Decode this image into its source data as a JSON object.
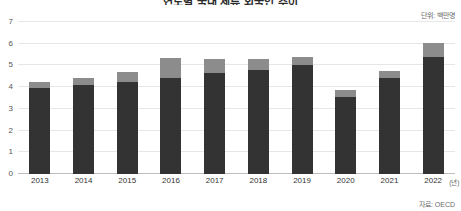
{
  "chart_data": {
    "type": "bar",
    "title": "연도별 국내 체류 외국인 추이",
    "subtitle": "",
    "xlabel": "(년)",
    "ylabel": "",
    "unit_note": "단위: 백만명",
    "source_note": "자료: OECD",
    "categories": [
      "2013",
      "2014",
      "2015",
      "2016",
      "2017",
      "2018",
      "2019",
      "2020",
      "2021",
      "2022"
    ],
    "series": [
      {
        "name": "하단(짙은 회색)",
        "color": "#333333",
        "values": [
          3.95,
          4.1,
          4.25,
          4.4,
          4.65,
          4.8,
          5.0,
          3.55,
          4.4,
          5.4
        ]
      },
      {
        "name": "상단(밝은 회색)",
        "color": "#8c8c8c",
        "values": [
          0.3,
          0.3,
          0.45,
          0.95,
          0.65,
          0.5,
          0.4,
          0.3,
          0.35,
          0.65
        ]
      }
    ],
    "totals": [
      4.25,
      4.4,
      4.7,
      5.35,
      5.3,
      5.3,
      5.4,
      3.85,
      4.75,
      6.05
    ],
    "stacked": true,
    "ylim": [
      0,
      7
    ],
    "yticks": [
      "0",
      "1",
      "2",
      "3",
      "4",
      "5",
      "6",
      "7"
    ],
    "grid": true,
    "legend": "none",
    "colors": {
      "bar_base": "#333333",
      "bar_top": "#8c8c8c",
      "gridline": "#e6e6e6",
      "axis": "#bdbdbd",
      "tick_text": "#555555",
      "note_text": "#6b6b6b",
      "background": "#ffffff"
    }
  }
}
